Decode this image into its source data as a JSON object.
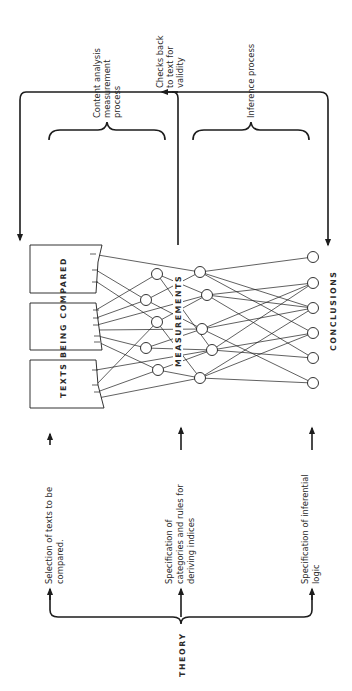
{
  "diagram": {
    "orientation": "rotated 90 degrees counter-clockwise",
    "theory_label": "THEORY",
    "texts_label": "TEXTS BEING COMPARED",
    "measurements_label": "MEASUREMENTS",
    "conclusions_label": "CONCLUSIONS",
    "feedback_label": [
      "Checks back",
      "to text for",
      "validity"
    ],
    "processes": [
      {
        "id": "content-analysis",
        "lines": [
          "Content analysis",
          "measurement",
          "process"
        ]
      },
      {
        "id": "inference",
        "lines": [
          "Inference process"
        ]
      }
    ],
    "theory_outputs": [
      {
        "id": "selection",
        "lines": [
          "Selection of texts to be",
          "compared."
        ]
      },
      {
        "id": "categories",
        "lines": [
          "Specification of",
          "categories and rules for",
          "deriving indices"
        ]
      },
      {
        "id": "inferential-logic",
        "lines": [
          "Specification of inferential",
          "logic"
        ]
      }
    ],
    "nodes": {
      "text_boxes": 3,
      "measurement_layer_1": 5,
      "measurement_layer_2": 5,
      "conclusions": 6
    },
    "colors": {
      "ink": "#1c1c1c",
      "background": "#ffffff"
    }
  }
}
